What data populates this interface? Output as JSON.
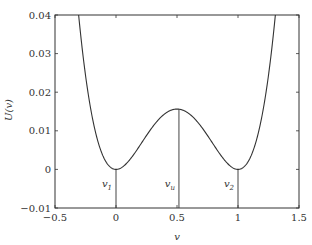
{
  "chart_data": {
    "type": "line",
    "title": "",
    "xlabel": "v",
    "ylabel": "U(v)",
    "xlim": [
      -0.5,
      1.5
    ],
    "ylim": [
      -0.01,
      0.04
    ],
    "grid": false,
    "legend": null,
    "x_ticks": [
      -0.5,
      0,
      0.5,
      1,
      1.5
    ],
    "x_tick_labels": [
      "−0.5",
      "0",
      "0.5",
      "1",
      "1.5"
    ],
    "y_ticks": [
      -0.01,
      0,
      0.01,
      0.02,
      0.03,
      0.04
    ],
    "y_tick_labels": [
      "−0.01",
      "0",
      "0.01",
      "0.02",
      "0.03",
      "0.04"
    ],
    "series": [
      {
        "name": "U(v)",
        "formula": "U(v) = v^2 (1 - v)^2 / 4",
        "x": [
          -0.31,
          -0.3,
          -0.25,
          -0.2,
          -0.15,
          -0.1,
          -0.05,
          0,
          0.05,
          0.1,
          0.15,
          0.2,
          0.25,
          0.3,
          0.35,
          0.4,
          0.45,
          0.5,
          0.55,
          0.6,
          0.65,
          0.7,
          0.75,
          0.8,
          0.85,
          0.9,
          0.95,
          1,
          1.05,
          1.1,
          1.15,
          1.2,
          1.25,
          1.3
        ],
        "y": [
          0.0412,
          0.038,
          0.0244,
          0.0144,
          0.0074,
          0.003,
          0.0007,
          0,
          0.0006,
          0.002,
          0.0041,
          0.0064,
          0.0088,
          0.011,
          0.0129,
          0.0144,
          0.0153,
          0.0156,
          0.0153,
          0.0144,
          0.0129,
          0.011,
          0.0088,
          0.0064,
          0.0041,
          0.002,
          0.0006,
          0,
          0.0007,
          0.003,
          0.0074,
          0.0144,
          0.0244,
          0.038
        ]
      }
    ],
    "vertical_markers": [
      {
        "label": "v",
        "subscript": "1",
        "x": 0,
        "y_top": 0
      },
      {
        "label": "v",
        "subscript": "u",
        "x": 0.516,
        "y_top": 0.0156
      },
      {
        "label": "v",
        "subscript": "2",
        "x": 1,
        "y_top": 0
      }
    ]
  }
}
